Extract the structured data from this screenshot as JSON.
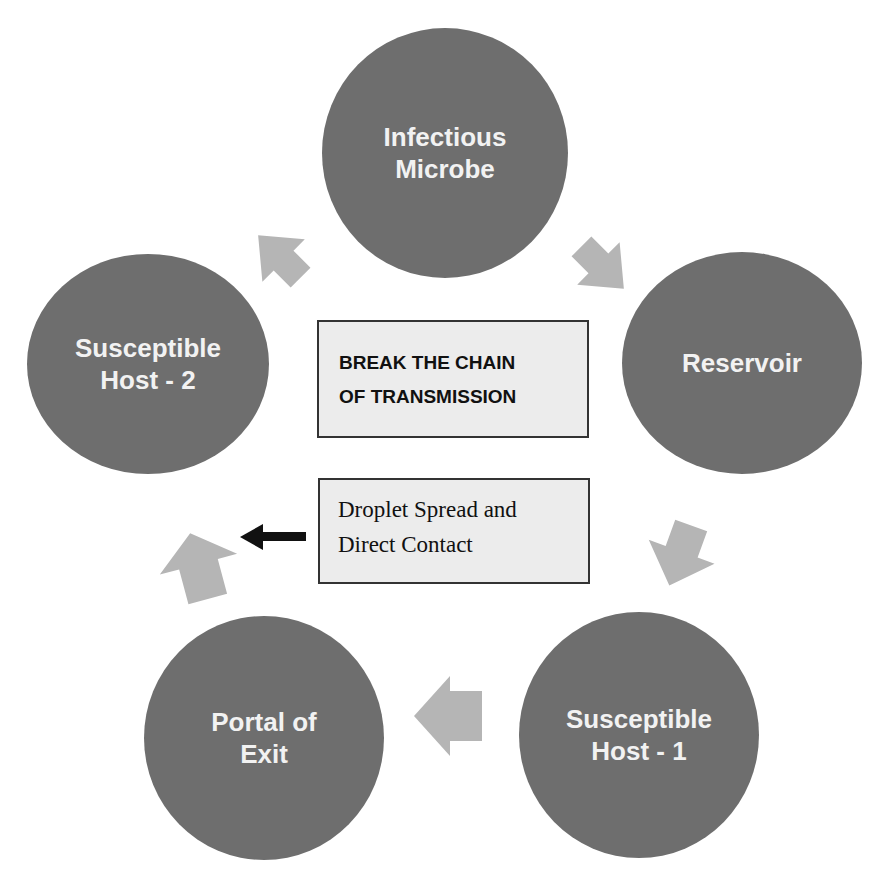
{
  "title": "BREAK THE CHAIN OF TRANSMISSION",
  "center_box": {
    "line1": "BREAK THE CHAIN",
    "line2": "OF TRANSMISSION"
  },
  "mode_box": {
    "line1": "Droplet Spread and",
    "line2": "Direct Contact"
  },
  "nodes": [
    {
      "id": "infectious-microbe",
      "line1": "Infectious",
      "line2": "Microbe"
    },
    {
      "id": "reservoir",
      "line1": "Reservoir",
      "line2": ""
    },
    {
      "id": "susceptible-host-1",
      "line1": "Susceptible",
      "line2": "Host - 1"
    },
    {
      "id": "portal-of-exit",
      "line1": "Portal of",
      "line2": "Exit"
    },
    {
      "id": "susceptible-host-2",
      "line1": "Susceptible",
      "line2": "Host - 2"
    }
  ],
  "colors": {
    "node_fill": "#6e6e6e",
    "node_text": "#f2f2f2",
    "cycle_arrow": "#b5b5b5",
    "pointer_arrow": "#111111",
    "box_fill": "#ececec",
    "box_border": "#333333"
  }
}
